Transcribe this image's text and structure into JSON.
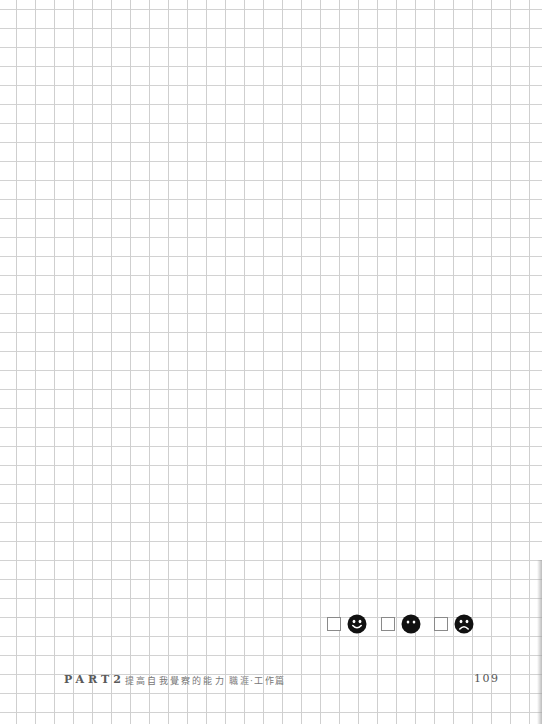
{
  "page": {
    "type": "grid-paper-notebook-page",
    "grid_color": "#cfcfcf",
    "grid_spacing_px": 19
  },
  "mood_selector": {
    "options": [
      {
        "label": "happy",
        "icon": "happy-face-icon",
        "checked": false
      },
      {
        "label": "neutral",
        "icon": "neutral-face-icon",
        "checked": false
      },
      {
        "label": "sad",
        "icon": "sad-face-icon",
        "checked": false
      }
    ]
  },
  "footer": {
    "part_label": "PART2",
    "chapter_title": "提高自我覺察的能力",
    "section_title": "職涯‧工作篇",
    "page_number": "109"
  }
}
